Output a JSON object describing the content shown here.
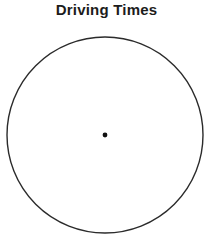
{
  "page": {
    "background_color": "#ffffff",
    "width": 213,
    "height": 242
  },
  "chart_title": "Driving Times",
  "chart_data": {
    "type": "pie",
    "title": "Driving Times",
    "subtitle": "",
    "labels": [],
    "values": [],
    "slices": [],
    "legend": [],
    "annotations": [],
    "grid": false,
    "legend_position": "none",
    "note": "Blank pie chart template: empty circle outline with a marked center point; no sectors, labels, or percentages are drawn.",
    "geometry": {
      "center_x": 105,
      "center_y": 135,
      "radius": 98,
      "outline_color": "#2b2b2b",
      "outline_width": 1.4,
      "fill_color": "#ffffff",
      "center_dot_radius": 2.4,
      "center_dot_color": "#111111"
    }
  }
}
